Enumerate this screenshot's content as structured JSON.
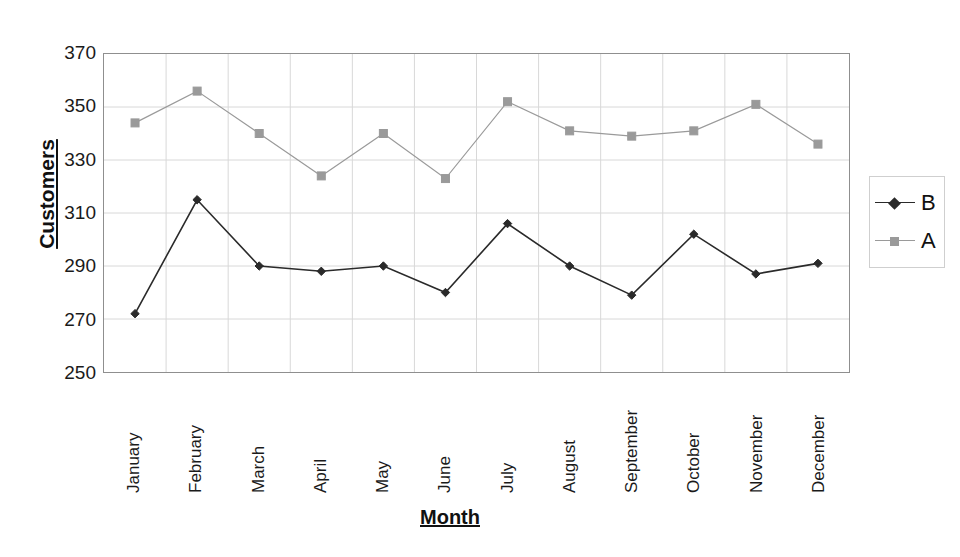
{
  "chart_data": {
    "type": "line",
    "title": "",
    "xlabel": "Month",
    "ylabel": "Customers",
    "categories": [
      "January",
      "February",
      "March",
      "April",
      "May",
      "June",
      "July",
      "August",
      "September",
      "October",
      "November",
      "December"
    ],
    "ylim": [
      250,
      370
    ],
    "yticks": [
      250,
      270,
      290,
      310,
      330,
      350,
      370
    ],
    "grid": true,
    "legend_position": "right",
    "series": [
      {
        "name": "B",
        "color": "#2a2a2a",
        "marker": "diamond",
        "linestyle": "solid",
        "values": [
          272,
          315,
          290,
          288,
          290,
          280,
          306,
          290,
          279,
          302,
          287,
          291
        ]
      },
      {
        "name": "A",
        "color": "#9a9a9a",
        "marker": "square",
        "linestyle": "solid",
        "values": [
          344,
          356,
          340,
          324,
          340,
          323,
          352,
          341,
          339,
          341,
          351,
          336
        ]
      }
    ]
  },
  "axes": {
    "y_title": "Customers",
    "x_title": "Month"
  },
  "legend": {
    "entries": [
      {
        "label": "B"
      },
      {
        "label": "A"
      }
    ]
  },
  "colors": {
    "series_b": "#2a2a2a",
    "series_a": "#9a9a9a",
    "grid": "#d8d8d8",
    "frame": "#8f8f8f",
    "text": "#1a1a1a"
  }
}
